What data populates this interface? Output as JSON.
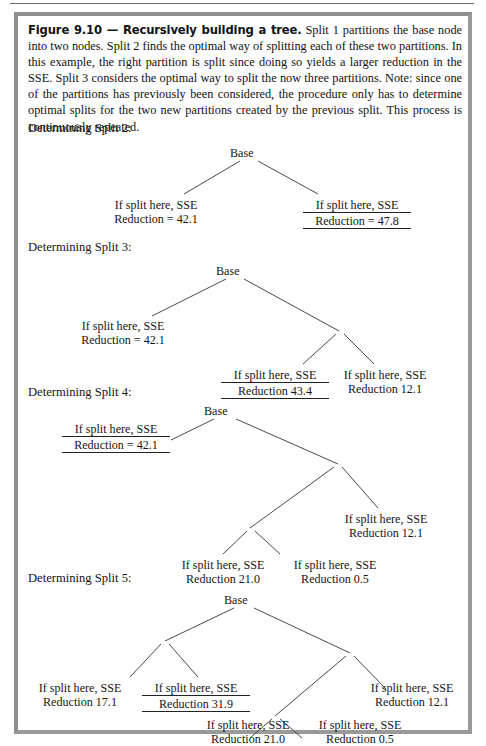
{
  "figure": {
    "caption_title": "Figure 9.10 — Recursively building a tree.",
    "caption_body": " Split 1 partitions the base node into two nodes. Split 2 finds the optimal way of splitting each of these two partitions. In this example, the right partition is split since doing so yields a larger reduction in the SSE. Split 3 considers the optimal way to split the now three partitions. Note: since one of the partitions has previously been considered, the procedure only has to determine optimal splits for the two new partitions created by the previous split. This process is continuously repeated.",
    "border_color": "#9a9a9a",
    "edge_color": "#4a4a4a",
    "text_color": "#161616"
  },
  "trees": [
    {
      "label": "Determining Split 2:",
      "root": "Base",
      "leaves": [
        {
          "line1": "If split here, SSE",
          "line2": "Reduction = 42.1",
          "selected": false
        },
        {
          "line1": "If split here, SSE",
          "line2": "Reduction = 47.8",
          "selected": true
        }
      ]
    },
    {
      "label": "Determining Split 3:",
      "root": "Base",
      "leaves": [
        {
          "line1": "If split here, SSE",
          "line2": "Reduction = 42.1",
          "selected": false
        },
        {
          "line1": "If split here, SSE",
          "line2": "Reduction 43.4",
          "selected": true
        },
        {
          "line1": "If split here, SSE",
          "line2": "Reduction 12.1",
          "selected": false
        }
      ]
    },
    {
      "label": "Determining Split 4:",
      "root": "Base",
      "leaves": [
        {
          "line1": "If split here, SSE",
          "line2": "Reduction = 42.1",
          "selected": true
        },
        {
          "line1": "If split here, SSE",
          "line2": "Reduction 21.0",
          "selected": false
        },
        {
          "line1": "If split here, SSE",
          "line2": "Reduction 0.5",
          "selected": false
        },
        {
          "line1": "If split here, SSE",
          "line2": "Reduction 12.1",
          "selected": false
        }
      ]
    },
    {
      "label": "Determining Split 5:",
      "root": "Base",
      "leaves": [
        {
          "line1": "If split here, SSE",
          "line2": "Reduction 17.1",
          "selected": false
        },
        {
          "line1": "If split here, SSE",
          "line2": "Reduction 31.9",
          "selected": true
        },
        {
          "line1": "If split here, SSE",
          "line2": "Reduction 21.0",
          "selected": false
        },
        {
          "line1": "If split here, SSE",
          "line2": "Reduction 0.5",
          "selected": false
        },
        {
          "line1": "If split here, SSE",
          "line2": "Reduction 12.1",
          "selected": false
        }
      ]
    }
  ]
}
